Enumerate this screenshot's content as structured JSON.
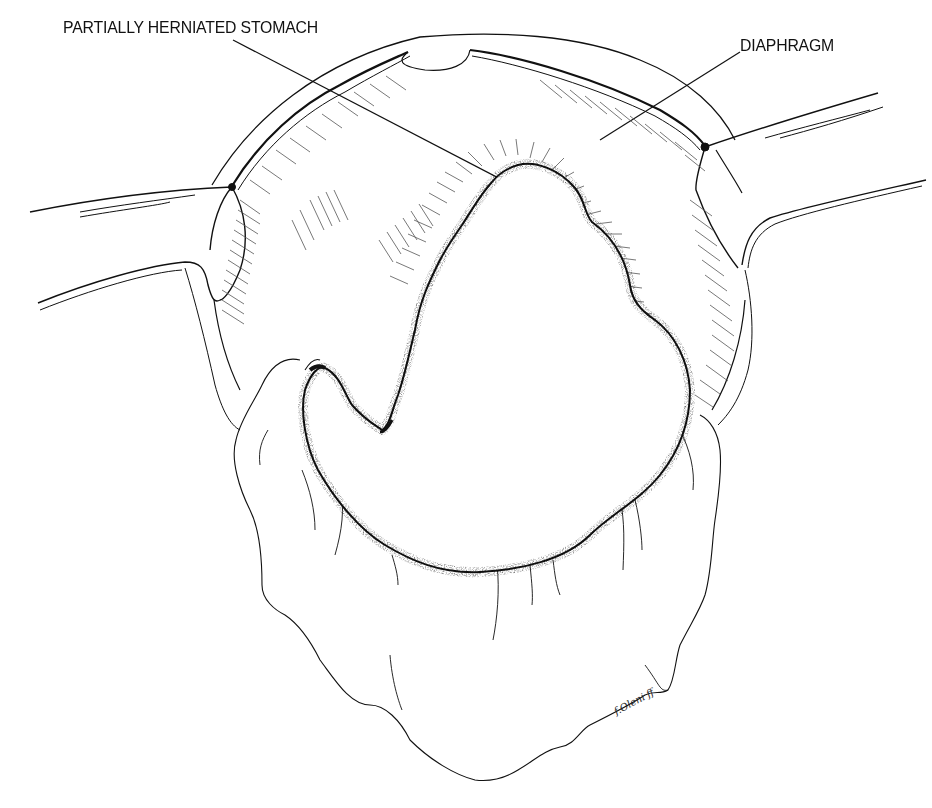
{
  "figure": {
    "type": "surgical line illustration",
    "labels": {
      "stomach": "PARTIALLY HERNIATED STOMACH",
      "diaphragm": "DIAPHRAGM"
    },
    "signature": "f.Oleni ff"
  },
  "colors": {
    "background": "#ffffff",
    "ink": "#111111",
    "hatch": "#555555"
  }
}
